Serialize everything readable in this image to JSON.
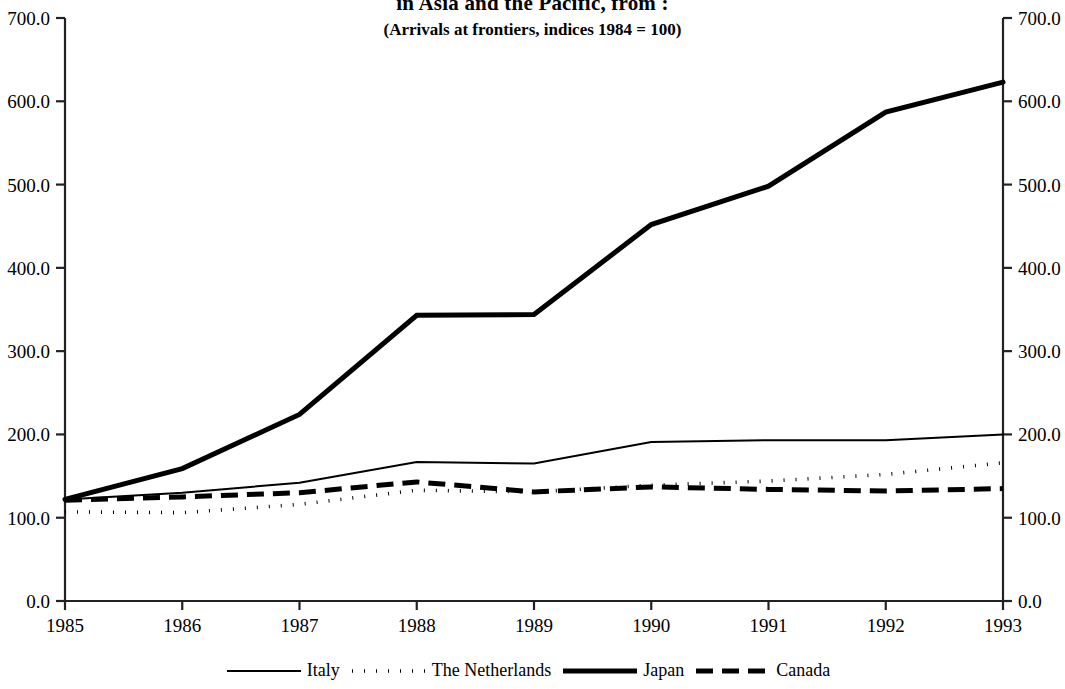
{
  "header": {
    "title": "in Asia and the Pacific, from :",
    "subtitle": "(Arrivals at frontiers, indices 1984 = 100)"
  },
  "chart_data": {
    "type": "line",
    "title": "in Asia and the Pacific, from :",
    "subtitle": "(Arrivals at frontiers, indices 1984 = 100)",
    "xlabel": "",
    "ylabel": "",
    "x": [
      1985,
      1986,
      1987,
      1988,
      1989,
      1990,
      1991,
      1992,
      1993
    ],
    "xticklabels": [
      "1985",
      "1986",
      "1987",
      "1988",
      "1989",
      "1990",
      "1991",
      "1992",
      "1993"
    ],
    "ylim": [
      0.0,
      700.0
    ],
    "yticks": [
      0.0,
      100.0,
      200.0,
      300.0,
      400.0,
      500.0,
      600.0,
      700.0
    ],
    "yticklabels": [
      "0.0",
      "100.0",
      "200.0",
      "300.0",
      "400.0",
      "500.0",
      "600.0",
      "700.0"
    ],
    "y_axis_both_sides": true,
    "grid": false,
    "legend_position": "bottom",
    "series": [
      {
        "name": "Italy",
        "style": "solid-thin",
        "color": "#000000",
        "values": [
          122,
          130,
          142,
          167,
          165,
          191,
          193,
          193,
          200
        ]
      },
      {
        "name": "The Netherlands",
        "style": "dotted",
        "color": "#000000",
        "values": [
          107,
          106,
          116,
          133,
          131,
          139,
          144,
          152,
          166
        ]
      },
      {
        "name": "Japan",
        "style": "solid-thick",
        "color": "#000000",
        "values": [
          122,
          159,
          224,
          343,
          344,
          452,
          498,
          587,
          623
        ]
      },
      {
        "name": "Canada",
        "style": "dashed-thick",
        "color": "#000000",
        "values": [
          121,
          125,
          130,
          143,
          131,
          137,
          134,
          132,
          135
        ]
      }
    ]
  },
  "axes": {
    "left_ticks": [
      "700.0",
      "600.0",
      "500.0",
      "400.0",
      "300.0",
      "200.0",
      "100.0",
      "0.0"
    ],
    "right_ticks": [
      "700.0",
      "600.0",
      "500.0",
      "400.0",
      "300.0",
      "200.0",
      "100.0",
      "0.0"
    ],
    "x_ticks": [
      "1985",
      "1986",
      "1987",
      "1988",
      "1989",
      "1990",
      "1991",
      "1992",
      "1993"
    ]
  },
  "legend": {
    "items": [
      {
        "label": "Italy",
        "style": "solid-thin"
      },
      {
        "label": "The Netherlands",
        "style": "dotted"
      },
      {
        "label": "Japan",
        "style": "solid-thick"
      },
      {
        "label": "Canada",
        "style": "dashed-thick"
      }
    ]
  }
}
